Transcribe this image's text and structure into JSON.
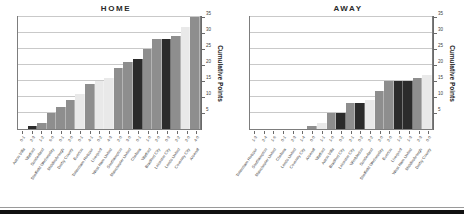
{
  "figure": {
    "y_axis_title": "Cumulative Points",
    "y_ticks": [
      5,
      10,
      15,
      20,
      25,
      30,
      35
    ],
    "y_min": 0,
    "y_max": 35,
    "gridlines": true,
    "bar_colors": {
      "light": "#e9e9e9",
      "medium": "#8e8e8e",
      "dark": "#2b2b2b"
    }
  },
  "panels": [
    {
      "title": "HOME"
    },
    {
      "title": "AWAY"
    }
  ],
  "chart_data": [
    {
      "type": "bar",
      "title": "HOME",
      "xlabel": "",
      "ylabel": "Cumulative Points",
      "ylim": [
        0,
        35
      ],
      "yticks": [
        5,
        10,
        15,
        20,
        25,
        30,
        35
      ],
      "grid": true,
      "legend": "none",
      "categories": [
        "Aston Villa",
        "Watford",
        "Sunderland",
        "Sheffield Wednesday",
        "Middlesbrough",
        "Derby County",
        "Everton",
        "Tottenham Hotspur",
        "Liverpool",
        "West Ham United",
        "Southampton",
        "Manchester United",
        "Chelsea",
        "Watford",
        "Bradford City",
        "Leicester City",
        "Leeds United",
        "Coventry City",
        "Arsenal"
      ],
      "scores": [
        "0-1",
        "2-3",
        "1-2",
        "6-0",
        "0-1",
        "2-0",
        "0-1",
        "4-1",
        "0-2",
        "4-3",
        "2-0",
        "3-0",
        "0-1",
        "1-0",
        "2-0",
        "0-3",
        "2-2",
        "2-0",
        "4-0"
      ],
      "values": [
        0,
        1,
        2,
        5,
        7,
        9,
        11,
        14,
        15,
        16,
        19,
        21,
        22,
        25,
        28,
        28,
        29,
        32,
        35
      ],
      "shades": [
        "light",
        "dark",
        "medium",
        "medium",
        "medium",
        "medium",
        "light",
        "medium",
        "light",
        "light",
        "medium",
        "medium",
        "dark",
        "medium",
        "medium",
        "dark",
        "medium",
        "light",
        "medium"
      ]
    },
    {
      "type": "bar",
      "title": "AWAY",
      "xlabel": "",
      "ylabel": "Cumulative Points",
      "ylim": [
        0,
        35
      ],
      "yticks": [
        5,
        10,
        15,
        20,
        25,
        30,
        35
      ],
      "grid": true,
      "legend": "none",
      "categories": [
        "Tottenham Hotspur",
        "Southampton",
        "Manchester United",
        "Chelsea",
        "Leeds United",
        "Coventry City",
        "Arsenal",
        "Watford",
        "Aston Villa",
        "Bradford City",
        "Leicester City",
        "Wimbledon",
        "Sunderland",
        "Sheffield Wednesday",
        "Everton",
        "Liverpool",
        "West Ham United",
        "Middlesbrough",
        "Derby County"
      ],
      "scores": [
        "1-3",
        "2-4",
        "1-6",
        "0-1",
        "2-3",
        "1-4",
        "0-0",
        "1-1",
        "1-0",
        "0-2",
        "2-1",
        "0-2",
        "2-2",
        "2-0",
        "2-0",
        "1-2",
        "1-3",
        "2-3",
        "0-0"
      ],
      "values": [
        0,
        0,
        0,
        0,
        0,
        0,
        1,
        2,
        5,
        5,
        8,
        8,
        9,
        12,
        15,
        15,
        15,
        16,
        17
      ],
      "shades": [
        "light",
        "light",
        "light",
        "light",
        "light",
        "light",
        "medium",
        "light",
        "medium",
        "dark",
        "medium",
        "dark",
        "light",
        "medium",
        "medium",
        "dark",
        "dark",
        "medium",
        "light"
      ]
    }
  ]
}
